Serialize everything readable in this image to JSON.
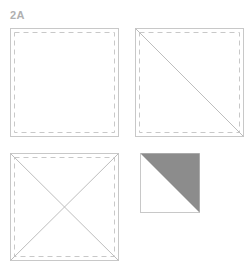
{
  "figure": {
    "label": "2A",
    "colors": {
      "outline": "#c8c8c8",
      "dashed": "#c8c8c8",
      "diagonal": "#bdbdbd",
      "fill": "#8c8c8c"
    },
    "panels": [
      {
        "name": "plain-square",
        "diagonals": "none",
        "seam_allowance": "dashed"
      },
      {
        "name": "single-diagonal-square",
        "diagonals": "top-left to bottom-right",
        "seam_allowance": "dashed"
      },
      {
        "name": "double-diagonal-square",
        "diagonals": "both",
        "seam_allowance": "dashed"
      },
      {
        "name": "half-square-triangle",
        "diagonals": "top-left to bottom-right",
        "fill": "upper-right triangle shaded"
      }
    ]
  }
}
